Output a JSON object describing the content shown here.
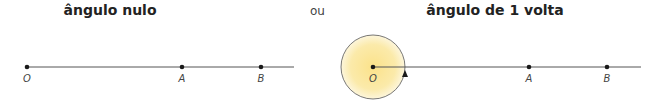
{
  "left": {
    "title": "ângulo nulo",
    "labels": {
      "o": "O",
      "a": "A",
      "b": "B"
    }
  },
  "separator": "ou",
  "right": {
    "title": "ângulo de 1 volta",
    "labels": {
      "o": "O",
      "a": "A",
      "b": "B"
    }
  },
  "colors": {
    "fill": "#f8e7a0",
    "line": "#555555",
    "point": "#1a1a1a"
  }
}
